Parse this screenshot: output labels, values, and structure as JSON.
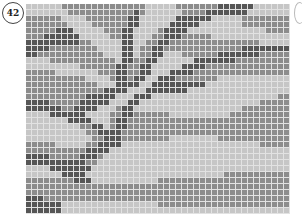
{
  "figure": {
    "number": "42",
    "columns": 44,
    "rows": 35,
    "colors": {
      "light": "#c6c6c6",
      "mid": "#8c8c8c",
      "dark": "#565656",
      "gridline": "#e2e2e2"
    },
    "pattern": [
      "LLLLLLMMMMMMMMMMMMMMLLLLLMMMMMMMDDDDDDLLLLLL",
      "LLLLLLLMMMMMMMMMMMDMLLLLLLMMMMDDDDDDDLLLLLLL",
      "MMMMMMLLLLMMMMMMMDDLLLLLLDDDDDDLLLLLMMMMMMMM",
      "MMMMMMMLLLLMMMMMMDDLLLLLDDDDDLLLLLLLMMMMMMMM",
      "MMMMMDDDLLLLLMMMDDLLLLMDDDDLLLLLLLLLLLLLMMMM",
      "MMMDDDDDDLLLLLMMDDLLLMMDDDMMMMMLLLLLLLLLLLLL",
      "DDDDDDDDDMMLLLLLDDLLMMDDMMMMMMMMMMMMMMMLLLLL",
      "DDDDMMMMMMMMLLLLDDLMMDDMMMMMMMMMMMMMDDDDDDDD",
      "DDMMMMMMMMMMMLLLDDLMMDDLLLMMMMMMDDDDDDDMMMMM",
      "LLLLMMMMMMMMMMMLDDMMDDLLLLLLDDDDDDDMMMMMMMMM",
      "LLLLLLLLLMMMMMMDDMMDDLLLLLDDDDMMMMMMMMMMMMMM",
      "MMMMMLLLLLLLMMMDDMMDDLLLDDDDMMMMMMMMMMMMMMMM",
      "MMMMMMMMMMLLLLMDDMDDLLDDDMMMMMMMLLLLLLLLLLLL",
      "MMMMMMMMMMMMLLLDDDDLLDDDDDDDDDLLLLLLLLLLLLLL",
      "MMMMMMMMMMMMMDDDDLLLDDDDDDDLLLLLLLLLLLLLLLLL",
      "MMMMMMMMMMDDDDDLLLDDDLLLLLLLLLLLLLLLLLLLLLMM",
      "DDDDMMMMMDDDDDLLLDDLLLLLLLLLLLLLLLLLLLLMMMMM",
      "DDDDDDMMDDDDLLLMDDLLLLLLLLLLLLLLLLLLMMMMMMMM",
      "LLLLDDDDDDLLLLMMDDMMMMMMLLLLLLLLLLMMMMMMMMMM",
      "LLLLLLLDDDDLLLMDDMMMMMMMMMMMMMMMMMMMMMMMMMMM",
      "LLLLLLLLLMMDDLMDDMMMMMMMMMMMMMMMMMMMMMMMMMMM",
      "LLLLLLLLLLMMDDDDMMMMMMMMMMMMMMMMMMMMMMMMMMMM",
      "LLLLLLLLLLLMMDDDMMMMMMMMLLLLLLLLMMMMMMMMMMMM",
      "MMMMMLLLLLMMDDDDLLLLLLLLLLLLLLLLLLLLLLLMMMMM",
      "MMMMMMMMMMDDDDLLLLLLLLLLLLLLLLLLLLLLLLLLLLLL",
      "DDDDMMMMMDDDMLLLLLLLLLLLLLLLLLLLLLLLLLLLLLLL",
      "DDDDDDDDDDMMLLLLLLLLLLLLLLLLLLLLLLLLLLLLLLLL",
      "LLLLDDDDDDDLLLLLLLLLLLLLLLLLLLLLLLLLLLLLLLLL",
      "LLLLLLDDDDLLLLLLLLLLLLLLLLLLLLLLLMMMMMMMMMMM",
      "MMMMMMMMDDDLLLLLLLLLLLMMMMMMMMMMMMMMMMMMMMMM",
      "MMMMMMMMMMMMMMMMMMMMMMMMMMMMMMMMMMMMMMMMMMMM",
      "MMMMMMMMMMMMMMMMMMMMMMMMMMMMMMMMMMMMMMMMMMMM",
      "DDDMMMMMMMMMMMMMMMMMMMMMMMMMMMMMMMMMMMMMMMMM",
      "DDDDDDLLLLLLLLLLLLLLLLMMMMMMMMMMMMMMMMMMMMMM",
      "DDDDDDLLLLLLLLLLLLLLLLLLLLLLLLLLLLLLLLLLLLLL"
    ]
  }
}
